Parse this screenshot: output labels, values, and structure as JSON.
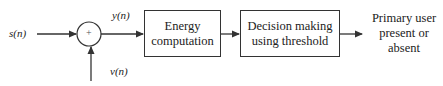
{
  "diagram": {
    "input_signal": "s(n)",
    "noise_signal": "v(n)",
    "summed_signal": "y(n)",
    "adder_symbol": "+",
    "blocks": [
      {
        "id": "energy",
        "lines": [
          "Energy",
          "computation"
        ]
      },
      {
        "id": "decision",
        "lines": [
          "Decision making",
          "using threshold"
        ]
      }
    ],
    "output": {
      "lines": [
        "Primary user",
        "present or",
        "absent"
      ]
    },
    "colors": {
      "stroke": "#333333",
      "background": "#ffffff"
    }
  }
}
